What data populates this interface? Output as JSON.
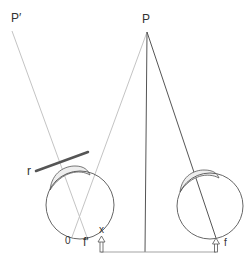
{
  "diagram": {
    "type": "optics-eye-mirror-reflection",
    "labels": {
      "object_point": "P",
      "virtual_image_point": "P′",
      "mirror": "r",
      "origin": "0",
      "left_fovea": "f′",
      "left_marker": "x",
      "right_fovea": "f"
    },
    "elements": [
      {
        "id": "object-point",
        "label": "P",
        "description": "Object point at top center, apex of sight lines"
      },
      {
        "id": "virtual-image",
        "label": "P′",
        "description": "Reflected (virtual) image point at top left"
      },
      {
        "id": "mirror",
        "label": "r",
        "description": "Thick dark line segment representing a mirror"
      },
      {
        "id": "left-eye",
        "description": "Circle with eyelid arc, left eye"
      },
      {
        "id": "right-eye",
        "description": "Circle with eyelid arc, right eye"
      },
      {
        "id": "arrow-left",
        "description": "Upward arrow below left eye at x"
      },
      {
        "id": "arrow-right",
        "description": "Upward arrow below right eye at f"
      },
      {
        "id": "baseline",
        "description": "Horizontal line connecting the two arrows"
      }
    ],
    "colors": {
      "light_line": "#c8c8c8",
      "dark_line": "#444444",
      "mirror": "#555555",
      "eye_outline": "#555555",
      "eyelid_fill": "#eeeeee",
      "text": "#333333"
    }
  }
}
